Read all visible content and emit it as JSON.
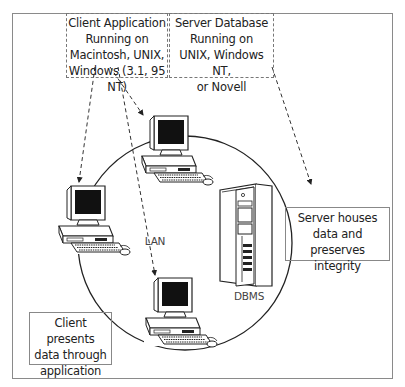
{
  "diagram": {
    "network_label": "LAN",
    "server_label": "DBMS",
    "callouts": {
      "client_application": [
        "Client Application",
        "Running on",
        "Macintosh, UNIX,",
        "Windows (3.1, 95 NT)"
      ],
      "server_database": [
        "Server Database",
        "Running on",
        "UNIX, Windows NT,",
        "or Novell"
      ],
      "server_role": [
        "Server houses",
        "data and",
        "preserves integrity"
      ],
      "client_role": [
        "Client presents",
        "data through",
        "application"
      ]
    },
    "nodes": [
      {
        "name": "client-top",
        "type": "workstation"
      },
      {
        "name": "client-left",
        "type": "workstation"
      },
      {
        "name": "client-bottom",
        "type": "workstation"
      },
      {
        "name": "server",
        "type": "tower-server"
      }
    ],
    "colors": {
      "line": "#222222",
      "frame": "#8a8a8a",
      "dash": "#777777"
    }
  }
}
